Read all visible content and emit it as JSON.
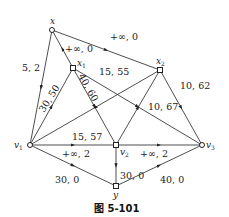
{
  "figure": {
    "caption": "图 5-101"
  },
  "nodes": [
    {
      "id": "x",
      "label": "x",
      "sub": "",
      "cx": 52,
      "cy": 30
    },
    {
      "id": "x1",
      "label": "x",
      "sub": "1",
      "cx": 73,
      "cy": 68
    },
    {
      "id": "x2",
      "label": "x",
      "sub": "2",
      "cx": 160,
      "cy": 70
    },
    {
      "id": "v1",
      "label": "v",
      "sub": "1",
      "cx": 30,
      "cy": 145
    },
    {
      "id": "v2",
      "label": "v",
      "sub": "2",
      "cx": 116,
      "cy": 145
    },
    {
      "id": "v3",
      "label": "v",
      "sub": "3",
      "cx": 202,
      "cy": 145
    },
    {
      "id": "y",
      "label": "y",
      "sub": "",
      "cx": 116,
      "cy": 186
    }
  ],
  "edges": [
    {
      "from": "x",
      "to": "v1",
      "label": "5, 2"
    },
    {
      "from": "x1",
      "to": "x",
      "label": "+∞, 0"
    },
    {
      "from": "x",
      "to": "x2",
      "label": "+∞, 0"
    },
    {
      "from": "v1",
      "to": "x1",
      "label": "30, 50"
    },
    {
      "from": "x1",
      "to": "v2",
      "label": "40, 60"
    },
    {
      "from": "x1",
      "to": "v3",
      "label": "15, 55"
    },
    {
      "from": "x2",
      "to": "v1",
      "label": "15, 57"
    },
    {
      "from": "v2",
      "to": "x2",
      "label": "10, 67"
    },
    {
      "from": "x2",
      "to": "v3",
      "label": "10, 62"
    },
    {
      "from": "v1",
      "to": "v2",
      "label": "+∞, 2"
    },
    {
      "from": "v2",
      "to": "v3",
      "label": "+∞, 2"
    },
    {
      "from": "v1",
      "to": "y",
      "label": "30, 0"
    },
    {
      "from": "v2",
      "to": "y",
      "label": "30, 0"
    },
    {
      "from": "y",
      "to": "v3",
      "label": "40, 0"
    }
  ]
}
